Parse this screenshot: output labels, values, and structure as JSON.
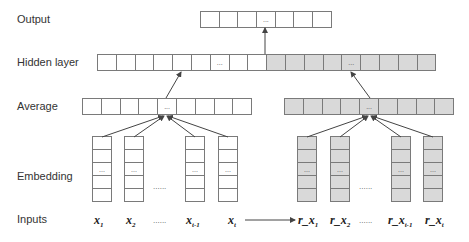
{
  "labels": {
    "output": "Output",
    "hidden": "Hidden layer",
    "average": "Average",
    "embedding": "Embedding",
    "inputs": "Inputs"
  },
  "ellipsis_cell": "...",
  "ellipsis_gap": "......",
  "output_layer": {
    "cells": 7,
    "dots_index": 3,
    "shade": "white"
  },
  "hidden_layer": {
    "cells": 18,
    "white_cells": 9,
    "gray_cells": 9,
    "dots_indices": [
      6,
      13
    ]
  },
  "average_left": {
    "cells": 9,
    "dots_index": 4,
    "shade": "white"
  },
  "average_right": {
    "cells": 9,
    "dots_index": 4,
    "shade": "gray"
  },
  "embedding": {
    "cells_per_column": 5,
    "dots_index": 2,
    "left_columns": 4,
    "right_columns": 4
  },
  "inputs_left": [
    {
      "base": "x",
      "sub": "1"
    },
    {
      "base": "x",
      "sub": "2"
    },
    {
      "base": "x",
      "sub": "t-1"
    },
    {
      "base": "x",
      "sub": "t"
    }
  ],
  "inputs_right": [
    {
      "base": "r_x",
      "sub": "1"
    },
    {
      "base": "r_x",
      "sub": "2"
    },
    {
      "base": "r_x",
      "sub": "t-1"
    },
    {
      "base": "r_x",
      "sub": "t"
    }
  ],
  "colors": {
    "gray_fill": "#d9d9d9",
    "border": "#7a7a7a",
    "arrow": "#444444"
  }
}
